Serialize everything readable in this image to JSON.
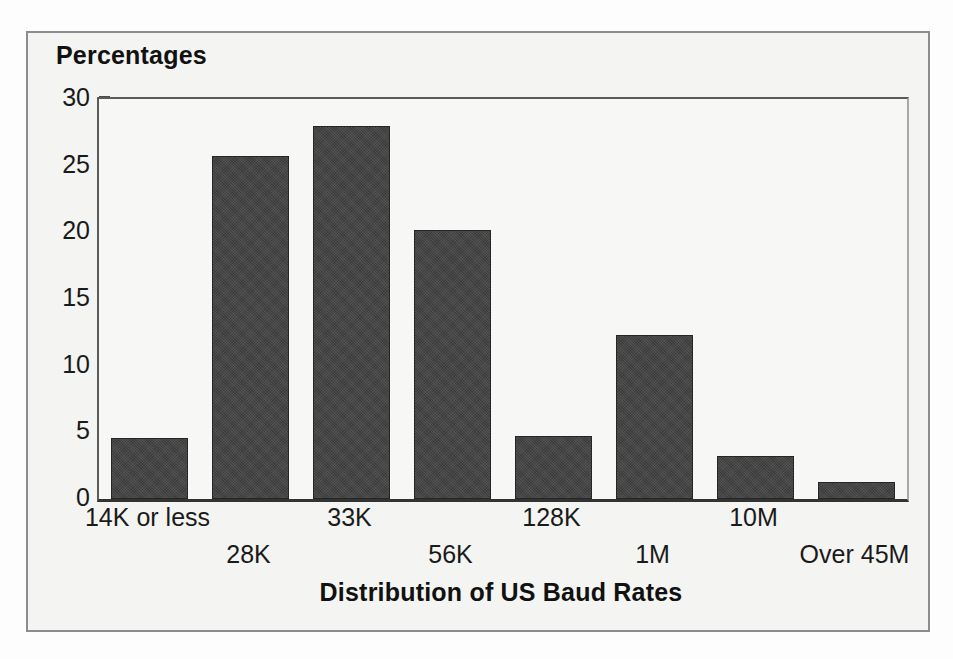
{
  "chart_data": {
    "type": "bar",
    "title": "",
    "xlabel": "Distribution of US Baud Rates",
    "ylabel": "Percentages",
    "categories": [
      "14K or less",
      "28K",
      "33K",
      "56K",
      "128K",
      "1M",
      "10M",
      "Over 45M"
    ],
    "values": [
      4.6,
      25.7,
      28.0,
      20.2,
      4.7,
      12.3,
      3.2,
      1.3
    ],
    "ylim": [
      0,
      30
    ],
    "y_ticks": [
      0,
      5,
      10,
      15,
      20,
      25,
      30
    ],
    "y_tick_labels": [
      "0",
      "5",
      "10",
      "15",
      "20",
      "25",
      "30"
    ],
    "y_minor_ticks": [
      2.5,
      7.5,
      12.5,
      17.5,
      22.5,
      27.5
    ],
    "grid": false,
    "legend": null,
    "bar_color": "#3b3b3b",
    "bar_edge_color": "#262626",
    "axis_color": "#333333",
    "plot_background": "#f7f7f5",
    "figure_background": "#f4f4f2",
    "figure_border_color": "#8c8c8c",
    "label_stagger": true
  }
}
